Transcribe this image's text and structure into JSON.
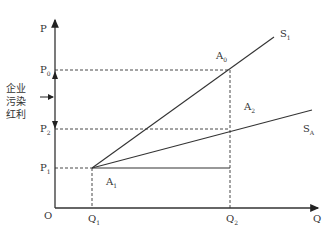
{
  "diagram": {
    "axes": {
      "y_label": "P",
      "x_label": "Q",
      "origin": "O"
    },
    "price_levels": [
      {
        "name": "P0",
        "base": "P",
        "sub": "0"
      },
      {
        "name": "P2",
        "base": "P",
        "sub": "2"
      },
      {
        "name": "P1",
        "base": "P",
        "sub": "1"
      }
    ],
    "quantity_levels": [
      {
        "name": "Q1",
        "base": "Q",
        "sub": "1"
      },
      {
        "name": "Q2",
        "base": "Q",
        "sub": "2"
      }
    ],
    "points": [
      {
        "name": "A0",
        "base": "A",
        "sub": "0"
      },
      {
        "name": "A1",
        "base": "A",
        "sub": "1"
      },
      {
        "name": "A2",
        "base": "A",
        "sub": "2"
      }
    ],
    "curves": [
      {
        "name": "S1",
        "base": "S",
        "sub": "1"
      },
      {
        "name": "SA",
        "base": "S",
        "sub": "A"
      }
    ],
    "annotation": {
      "line1": "企业",
      "line2": "污染",
      "line3": "红利"
    }
  }
}
